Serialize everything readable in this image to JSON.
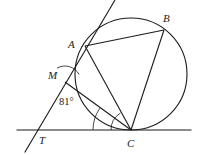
{
  "figure": {
    "type": "geometry-diagram",
    "stroke_color": "#1a1a1a",
    "background_color": "#ffffff",
    "canvas": {
      "width": 203,
      "height": 155
    }
  },
  "circle": {
    "name": "main-circle",
    "cx": 131,
    "cy": 74,
    "r": 56
  },
  "points": {
    "A": {
      "label": "A",
      "x": 85,
      "y": 46,
      "label_x": 68,
      "label_y": 39
    },
    "B": {
      "label": "B",
      "x": 164,
      "y": 30,
      "label_x": 163,
      "label_y": 13
    },
    "C": {
      "label": "C",
      "x": 131,
      "y": 130,
      "label_x": 127,
      "label_y": 138
    },
    "M": {
      "label": "M",
      "x": 65,
      "y": 82,
      "label_x": 48,
      "label_y": 70
    },
    "T": {
      "label": "T",
      "x": 36,
      "y": 130,
      "label_x": 39,
      "label_y": 135
    }
  },
  "segments": [
    {
      "name": "segment-AB",
      "from": "A",
      "to": "B"
    },
    {
      "name": "segment-AC",
      "from": "A",
      "to": "C"
    },
    {
      "name": "segment-BC",
      "from": "B",
      "to": "C"
    },
    {
      "name": "segment-MC",
      "from": "M",
      "to": "C"
    }
  ],
  "lines": {
    "baseline": {
      "name": "horizontal-base-line",
      "x1": 17,
      "y1": 130,
      "x2": 191,
      "y2": 130
    },
    "tangent": {
      "name": "tangent-line-through-A",
      "x1": 115,
      "y1": 0,
      "x2": 25,
      "y2": 152
    }
  },
  "angles": {
    "at_M": {
      "name": "angle-at-M",
      "value": "81°",
      "label_x": 59,
      "label_y": 97
    }
  },
  "arcs": {
    "at_M": {
      "name": "angle-arc-at-M",
      "cx": 65,
      "cy": 82,
      "r": 16,
      "start_deg": 120,
      "end_deg": 28
    },
    "at_C_inner": {
      "name": "angle-arc-at-C-inner",
      "cx": 131,
      "cy": 130,
      "r": 20,
      "start_deg": 180,
      "end_deg": 122
    },
    "at_C_outer": {
      "name": "angle-arc-at-C-outer",
      "cx": 131,
      "cy": 130,
      "r": 38,
      "start_deg": 180,
      "end_deg": 145
    }
  }
}
